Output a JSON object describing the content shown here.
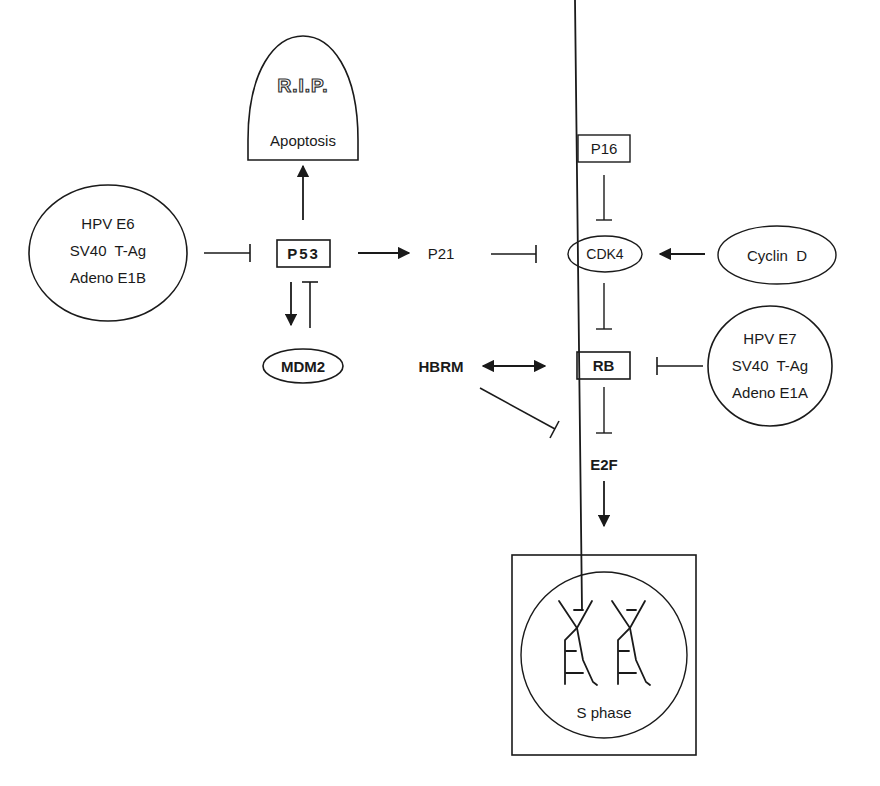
{
  "diagram": {
    "type": "signaling-pathway",
    "nodes": {
      "rip": {
        "title": "R.I.P.",
        "label": "Apoptosis",
        "shape": "tombstone"
      },
      "viral_left": {
        "lines": [
          "HPV E6",
          "SV40  T-Ag",
          "Adeno E1B"
        ],
        "shape": "ellipse"
      },
      "p53": {
        "label": "P53",
        "shape": "box",
        "bold": true
      },
      "p21": {
        "label": "P21",
        "shape": "text"
      },
      "p16": {
        "label": "P16",
        "shape": "box"
      },
      "cdk4": {
        "label": "CDK4",
        "shape": "ellipse"
      },
      "cyclin_d": {
        "label": "Cyclin  D",
        "shape": "ellipse"
      },
      "mdm2": {
        "label": "MDM2",
        "shape": "ellipse",
        "bold": true
      },
      "hbrm": {
        "label": "HBRM",
        "shape": "text",
        "bold": true
      },
      "rb": {
        "label": "RB",
        "shape": "box",
        "bold": true
      },
      "viral_right": {
        "lines": [
          "HPV E7",
          "SV40  T-Ag",
          "Adeno E1A"
        ],
        "shape": "ellipse"
      },
      "e2f": {
        "label": "E2F",
        "shape": "text",
        "bold": true
      },
      "s_phase": {
        "label": "S phase",
        "shape": "box-with-circle"
      }
    },
    "edges": [
      {
        "from": "p53",
        "to": "rip",
        "type": "activates"
      },
      {
        "from": "viral_left",
        "to": "p53",
        "type": "inhibits"
      },
      {
        "from": "p53",
        "to": "p21",
        "type": "activates"
      },
      {
        "from": "p21",
        "to": "cdk4",
        "type": "inhibits"
      },
      {
        "from": "p16",
        "to": "cdk4",
        "type": "inhibits"
      },
      {
        "from": "cyclin_d",
        "to": "cdk4",
        "type": "activates"
      },
      {
        "from": "p53",
        "to": "mdm2",
        "type": "activates"
      },
      {
        "from": "mdm2",
        "to": "p53",
        "type": "inhibits"
      },
      {
        "from": "cdk4",
        "to": "rb",
        "type": "inhibits"
      },
      {
        "from": "hbrm",
        "to": "rb",
        "type": "binds-bidirectional"
      },
      {
        "from": "viral_right",
        "to": "rb",
        "type": "inhibits"
      },
      {
        "from": "rb",
        "to": "e2f",
        "type": "inhibits"
      },
      {
        "from": "hbrm",
        "to": "e2f",
        "type": "inhibits"
      },
      {
        "from": "e2f",
        "to": "s_phase",
        "type": "activates"
      }
    ],
    "colors": {
      "ink": "#1a1a1a",
      "background": "#ffffff"
    }
  }
}
